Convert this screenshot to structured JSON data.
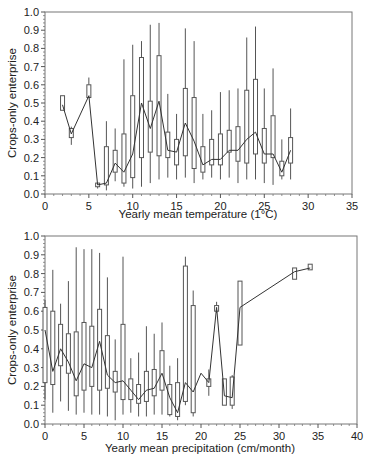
{
  "chart_data": [
    {
      "type": "box",
      "title": "",
      "xlabel": "Yearly mean temperature (1°C)",
      "ylabel": "Crops-only enterprise",
      "xlim": [
        0,
        35
      ],
      "ylim": [
        0,
        1.0
      ],
      "xticks": [
        0,
        5,
        10,
        15,
        20,
        25,
        30,
        35
      ],
      "yticks": [
        "0.0",
        "0.1",
        "0.2",
        "0.3",
        "0.4",
        "0.5",
        "0.6",
        "0.7",
        "0.8",
        "0.9",
        "1.0"
      ],
      "grid": false,
      "legend": null,
      "boxes": [
        {
          "x": 2,
          "low": 0.46,
          "q1": 0.46,
          "q3": 0.54,
          "high": 0.54,
          "mean": 0.49
        },
        {
          "x": 3,
          "low": 0.27,
          "q1": 0.31,
          "q3": 0.36,
          "high": 0.37,
          "mean": 0.33
        },
        {
          "x": 5,
          "low": 0.53,
          "q1": 0.53,
          "q3": 0.6,
          "high": 0.64,
          "mean": 0.54
        },
        {
          "x": 6,
          "low": 0.03,
          "q1": 0.04,
          "q3": 0.06,
          "high": 0.06,
          "mean": 0.05
        },
        {
          "x": 7,
          "low": 0.02,
          "q1": 0.05,
          "q3": 0.26,
          "high": 0.4,
          "mean": 0.06
        },
        {
          "x": 8,
          "low": 0.07,
          "q1": 0.12,
          "q3": 0.24,
          "high": 0.36,
          "mean": 0.17
        },
        {
          "x": 9,
          "low": 0.04,
          "q1": 0.06,
          "q3": 0.33,
          "high": 0.74,
          "mean": 0.12
        },
        {
          "x": 10,
          "low": 0.03,
          "q1": 0.09,
          "q3": 0.54,
          "high": 0.82,
          "mean": 0.22
        },
        {
          "x": 11,
          "low": 0.04,
          "q1": 0.2,
          "q3": 0.75,
          "high": 0.84,
          "mean": 0.5
        },
        {
          "x": 12,
          "low": 0.06,
          "q1": 0.23,
          "q3": 0.51,
          "high": 0.93,
          "mean": 0.36
        },
        {
          "x": 13,
          "low": 0.08,
          "q1": 0.21,
          "q3": 0.76,
          "high": 0.94,
          "mean": 0.51
        },
        {
          "x": 14,
          "low": 0.09,
          "q1": 0.2,
          "q3": 0.34,
          "high": 0.55,
          "mean": 0.24
        },
        {
          "x": 15,
          "low": 0.08,
          "q1": 0.16,
          "q3": 0.3,
          "high": 0.44,
          "mean": 0.23
        },
        {
          "x": 16,
          "low": 0.09,
          "q1": 0.21,
          "q3": 0.58,
          "high": 0.91,
          "mean": 0.39
        },
        {
          "x": 17,
          "low": 0.06,
          "q1": 0.14,
          "q3": 0.53,
          "high": 0.84,
          "mean": 0.29
        },
        {
          "x": 18,
          "low": 0.08,
          "q1": 0.12,
          "q3": 0.26,
          "high": 0.44,
          "mean": 0.16
        },
        {
          "x": 19,
          "low": 0.09,
          "q1": 0.16,
          "q3": 0.3,
          "high": 0.46,
          "mean": 0.19
        },
        {
          "x": 20,
          "low": 0.08,
          "q1": 0.16,
          "q3": 0.33,
          "high": 0.56,
          "mean": 0.19
        },
        {
          "x": 21,
          "low": 0.09,
          "q1": 0.23,
          "q3": 0.35,
          "high": 0.57,
          "mean": 0.24
        },
        {
          "x": 22,
          "low": 0.06,
          "q1": 0.18,
          "q3": 0.37,
          "high": 0.58,
          "mean": 0.24
        },
        {
          "x": 23,
          "low": 0.08,
          "q1": 0.17,
          "q3": 0.57,
          "high": 0.86,
          "mean": 0.3
        },
        {
          "x": 24,
          "low": 0.08,
          "q1": 0.22,
          "q3": 0.63,
          "high": 0.92,
          "mean": 0.34
        },
        {
          "x": 25,
          "low": 0.06,
          "q1": 0.17,
          "q3": 0.36,
          "high": 0.58,
          "mean": 0.22
        },
        {
          "x": 26,
          "low": 0.05,
          "q1": 0.2,
          "q3": 0.43,
          "high": 0.69,
          "mean": 0.22
        },
        {
          "x": 27,
          "low": 0.08,
          "q1": 0.1,
          "q3": 0.18,
          "high": 0.3,
          "mean": 0.12
        },
        {
          "x": 28,
          "low": 0.08,
          "q1": 0.17,
          "q3": 0.31,
          "high": 0.47,
          "mean": 0.24
        }
      ]
    },
    {
      "type": "box",
      "title": "",
      "xlabel": "Yearly mean precipitation (cm/month)",
      "ylabel": "Crops-only enterprise",
      "xlim": [
        0,
        40
      ],
      "ylim": [
        0,
        1.0
      ],
      "xticks": [
        0,
        5,
        10,
        15,
        20,
        25,
        30,
        35,
        40
      ],
      "yticks": [
        "0.0",
        "0.1",
        "0.2",
        "0.3",
        "0.4",
        "0.5",
        "0.6",
        "0.7",
        "0.8",
        "0.9",
        "1.0"
      ],
      "grid": false,
      "legend": null,
      "boxes": [
        {
          "x": 0,
          "low": 0.13,
          "q1": 0.22,
          "q3": 0.62,
          "high": 0.66,
          "mean": 0.5
        },
        {
          "x": 1,
          "low": 0.06,
          "q1": 0.21,
          "q3": 0.6,
          "high": 0.82,
          "mean": 0.28
        },
        {
          "x": 2,
          "low": 0.12,
          "q1": 0.31,
          "q3": 0.53,
          "high": 0.64,
          "mean": 0.4
        },
        {
          "x": 3,
          "low": 0.07,
          "q1": 0.27,
          "q3": 0.48,
          "high": 0.76,
          "mean": 0.33
        },
        {
          "x": 4,
          "low": 0.05,
          "q1": 0.15,
          "q3": 0.49,
          "high": 0.94,
          "mean": 0.23
        },
        {
          "x": 5,
          "low": 0.06,
          "q1": 0.18,
          "q3": 0.54,
          "high": 0.93,
          "mean": 0.32
        },
        {
          "x": 6,
          "low": 0.05,
          "q1": 0.2,
          "q3": 0.52,
          "high": 0.93,
          "mean": 0.3
        },
        {
          "x": 7,
          "low": 0.05,
          "q1": 0.18,
          "q3": 0.61,
          "high": 0.91,
          "mean": 0.44
        },
        {
          "x": 8,
          "low": 0.04,
          "q1": 0.19,
          "q3": 0.47,
          "high": 0.78,
          "mean": 0.26
        },
        {
          "x": 9,
          "low": 0.02,
          "q1": 0.17,
          "q3": 0.28,
          "high": 0.45,
          "mean": 0.22
        },
        {
          "x": 10,
          "low": 0.05,
          "q1": 0.13,
          "q3": 0.53,
          "high": 0.89,
          "mean": 0.23
        },
        {
          "x": 11,
          "low": 0.06,
          "q1": 0.13,
          "q3": 0.24,
          "high": 0.35,
          "mean": 0.18
        },
        {
          "x": 12,
          "low": 0.04,
          "q1": 0.11,
          "q3": 0.21,
          "high": 0.38,
          "mean": 0.13
        },
        {
          "x": 13,
          "low": 0.04,
          "q1": 0.12,
          "q3": 0.28,
          "high": 0.52,
          "mean": 0.18
        },
        {
          "x": 14,
          "low": 0.05,
          "q1": 0.15,
          "q3": 0.29,
          "high": 0.48,
          "mean": 0.19
        },
        {
          "x": 15,
          "low": 0.05,
          "q1": 0.18,
          "q3": 0.39,
          "high": 0.54,
          "mean": 0.27
        },
        {
          "x": 16,
          "low": 0.04,
          "q1": 0.05,
          "q3": 0.21,
          "high": 0.31,
          "mean": 0.14
        },
        {
          "x": 17,
          "low": 0.02,
          "q1": 0.04,
          "q3": 0.22,
          "high": 0.35,
          "mean": 0.06
        },
        {
          "x": 18,
          "low": 0.1,
          "q1": 0.12,
          "q3": 0.84,
          "high": 0.89,
          "mean": 0.22
        },
        {
          "x": 19,
          "low": 0.04,
          "q1": 0.06,
          "q3": 0.63,
          "high": 0.71,
          "mean": 0.17
        },
        {
          "x": 20,
          "low": 0.27,
          "q1": 0.27,
          "q3": 0.27,
          "high": 0.27,
          "mean": 0.27
        },
        {
          "x": 21,
          "low": 0.15,
          "q1": 0.2,
          "q3": 0.24,
          "high": 0.29,
          "mean": 0.22
        },
        {
          "x": 22,
          "low": 0.59,
          "q1": 0.6,
          "q3": 0.63,
          "high": 0.65,
          "mean": 0.62
        },
        {
          "x": 23,
          "low": 0.1,
          "q1": 0.1,
          "q3": 0.24,
          "high": 0.24,
          "mean": 0.15
        },
        {
          "x": 24,
          "low": 0.08,
          "q1": 0.1,
          "q3": 0.25,
          "high": 0.26,
          "mean": 0.14
        },
        {
          "x": 25,
          "low": 0.42,
          "q1": 0.42,
          "q3": 0.76,
          "high": 0.76,
          "mean": 0.62
        },
        {
          "x": 32,
          "low": 0.77,
          "q1": 0.77,
          "q3": 0.83,
          "high": 0.83,
          "mean": 0.81
        },
        {
          "x": 34,
          "low": 0.82,
          "q1": 0.82,
          "q3": 0.85,
          "high": 0.85,
          "mean": 0.83
        }
      ]
    }
  ],
  "charts": {
    "top": {
      "xlabel": "Yearly mean temperature (1°C)",
      "ylabel": "Crops-only enterprise"
    },
    "bottom": {
      "xlabel": "Yearly mean precipitation (cm/month)",
      "ylabel": "Crops-only enterprise"
    }
  },
  "colors": {
    "line": "#333333",
    "box_stroke": "#555555",
    "frame": "#777777",
    "text": "#222222"
  }
}
